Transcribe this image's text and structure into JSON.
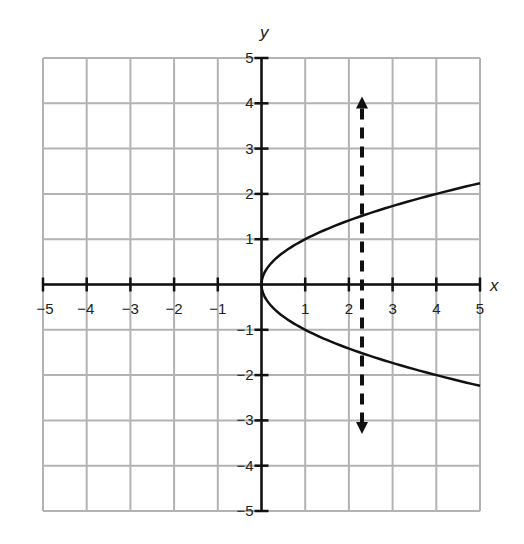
{
  "chart_data": {
    "type": "line",
    "title": "",
    "xlabel": "x",
    "ylabel": "y",
    "xlim": [
      -5,
      5
    ],
    "ylim": [
      -5,
      5
    ],
    "grid": true,
    "x_ticks": [
      -5,
      -4,
      -3,
      -2,
      -1,
      1,
      2,
      3,
      4,
      5
    ],
    "x_tick_labels": [
      "−5",
      "−4",
      "−3",
      "−2",
      "−1",
      "1",
      "2",
      "3",
      "4",
      "5"
    ],
    "y_ticks": [
      5,
      4,
      3,
      2,
      1,
      -1,
      -2,
      -3,
      -4,
      -5
    ],
    "y_tick_labels": [
      "5",
      "4",
      "3",
      "2",
      "1",
      "−1",
      "−2",
      "−3",
      "−4",
      "−5"
    ],
    "series": [
      {
        "name": "x = y^2 (sideways parabola)",
        "style": "solid",
        "points": [
          [
            5,
            2.24
          ],
          [
            4,
            2
          ],
          [
            3,
            1.73
          ],
          [
            2,
            1.41
          ],
          [
            1,
            1
          ],
          [
            0.25,
            0.5
          ],
          [
            0,
            0
          ],
          [
            0.25,
            -0.5
          ],
          [
            1,
            -1
          ],
          [
            2,
            -1.41
          ],
          [
            3,
            -1.73
          ],
          [
            4,
            -2
          ],
          [
            5,
            -2.24
          ]
        ]
      },
      {
        "name": "vertical line test",
        "style": "dashed-arrow",
        "points": [
          [
            2.3,
            4.15
          ],
          [
            2.3,
            -3.3
          ]
        ]
      }
    ],
    "colors": {
      "grid": "#b3b3b3",
      "axis": "#111111",
      "curve": "#111111"
    }
  }
}
